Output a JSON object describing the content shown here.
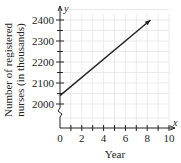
{
  "chart_data": {
    "type": "line",
    "title": "",
    "xlabel": "Year",
    "ylabel": "Number of registered nurses (in thousands)",
    "ylabel_lines": [
      "Number of registered",
      "nurses (in thousands)"
    ],
    "x_axis_var": "x",
    "y_axis_var": "y",
    "xlim": [
      0,
      10
    ],
    "ylim": [
      2000,
      2400
    ],
    "y_axis_break": true,
    "x_ticks": [
      0,
      2,
      4,
      6,
      8,
      10
    ],
    "x_tick_labels": [
      "0",
      "2",
      "4",
      "6",
      "8",
      "10"
    ],
    "x_minor_ticks": [
      1,
      3,
      5,
      7,
      9
    ],
    "y_ticks": [
      2000,
      2100,
      2200,
      2300,
      2400
    ],
    "y_tick_labels": [
      "2000",
      "2100",
      "2200",
      "2300",
      "2400"
    ],
    "grid": true,
    "series": [
      {
        "name": "Registered nurses",
        "x": [
          0,
          8.3
        ],
        "values": [
          2040,
          2400
        ],
        "arrow_end": true,
        "color": "#222222"
      }
    ]
  }
}
